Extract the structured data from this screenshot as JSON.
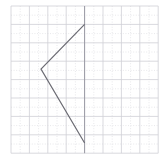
{
  "figure": {
    "title": "",
    "background_color": "#ffffff",
    "width": 162,
    "height": 165
  },
  "grid": {
    "major_color": "#cfcfd6",
    "minor_color": "#d8d8de",
    "axis_color": "#9a9aa4",
    "major_spacing": 18.4,
    "minor_spacing": 9.2,
    "x_major_lines": [
      11,
      29.4,
      47.8,
      66.2,
      84.6,
      103,
      121.4,
      139.8,
      158.2
    ],
    "y_major_lines": [
      6,
      24.4,
      42.8,
      61.2,
      79.6,
      98,
      116.4,
      134.8,
      153.2
    ],
    "vertical_axis_x": 84.6,
    "grid_on": true
  },
  "chart_data": {
    "type": "line",
    "title": "",
    "xlabel": "",
    "ylabel": "",
    "xlim": [
      0,
      8
    ],
    "ylim": [
      0,
      8
    ],
    "grid": true,
    "legend_position": "none",
    "series": [
      {
        "name": "chevron-polyline",
        "color": "#6b6b73",
        "line_width": 1.2,
        "closed": false,
        "points_px": [
          [
            84.6,
            24.4
          ],
          [
            41.0,
            69.0
          ],
          [
            84.6,
            143.0
          ]
        ],
        "points_grid": [
          [
            4.0,
            7.0
          ],
          [
            1.63,
            4.57
          ],
          [
            4.0,
            0.55
          ]
        ]
      }
    ],
    "annotations": [],
    "tick_labels": {
      "x": [],
      "y": []
    }
  }
}
